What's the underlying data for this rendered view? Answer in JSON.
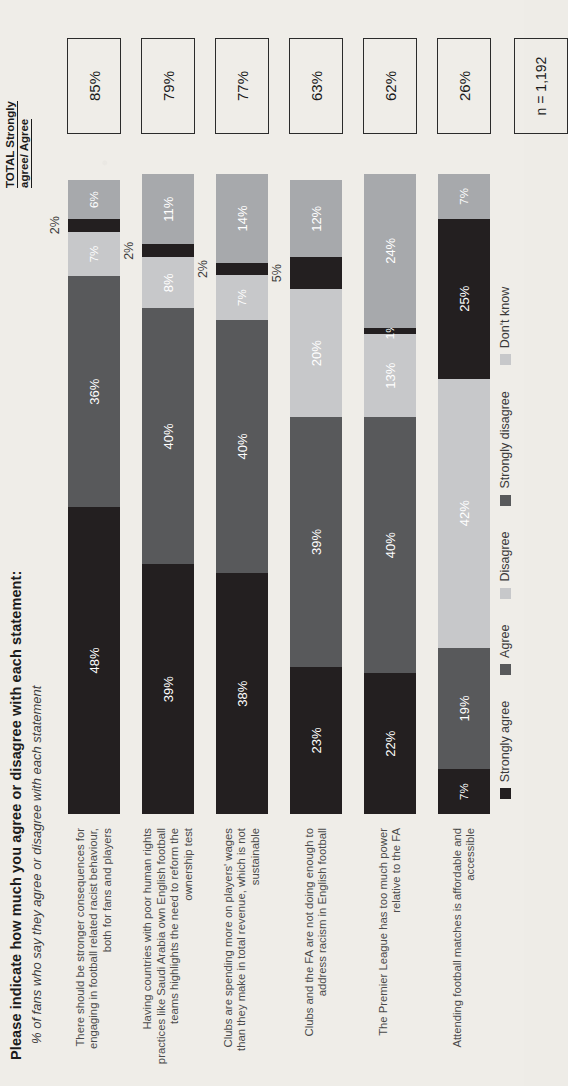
{
  "header": {
    "title": "Please indicate how much you agree or disagree with each statement:",
    "subtitle": "% of fans who say they agree or disagree with each statement",
    "total_column_line1": "TOTAL Strongly",
    "total_column_line2": "agree/ Agree",
    "sample_size": "n = 1,192"
  },
  "chart_data": {
    "type": "bar",
    "orientation": "horizontal-stacked",
    "title": "Please indicate how much you agree or disagree with each statement:",
    "subtitle": "% of fans who say they agree or disagree with each statement",
    "xlabel": "",
    "ylabel": "",
    "xlim": [
      0,
      100
    ],
    "grid": false,
    "legend_position": "bottom",
    "categories": [
      "There should be stronger consequences for engaging in football related racist behaviour, both for fans and players",
      "Having countries with poor human rights practices like Saudi Arabia own English football teams highlights the need to reform the ownership test",
      "Clubs are spending more on players' wages than they make in total revenue, which is not sustainable",
      "Clubs and the FA are not doing enough to address racism in English football",
      "The Premier League has too much power relative to the FA",
      "Attending football matches is affordable and accessible"
    ],
    "series": [
      {
        "name": "Strongly agree",
        "color": "#231f20",
        "values": [
          48,
          39,
          38,
          23,
          22,
          7
        ]
      },
      {
        "name": "Agree",
        "color": "#58595b",
        "values": [
          36,
          40,
          40,
          39,
          40,
          19
        ]
      },
      {
        "name": "Disagree",
        "color": "#c7c8ca",
        "values": [
          7,
          8,
          7,
          20,
          13,
          42
        ]
      },
      {
        "name": "Strongly disagree",
        "color": "#231f20",
        "values": [
          2,
          2,
          2,
          5,
          1,
          25
        ]
      },
      {
        "name": "Don't know",
        "color": "#a7a9ac",
        "values": [
          6,
          11,
          14,
          12,
          24,
          7
        ]
      }
    ],
    "totals": [
      "85%",
      "79%",
      "77%",
      "63%",
      "62%",
      "26%"
    ],
    "annotations": [
      "n = 1,192"
    ]
  },
  "rows": [
    {
      "label": "There should be stronger consequences for engaging in football related racist behaviour, both for fans and players",
      "total": "85%",
      "segments": [
        {
          "name": "Strongly agree",
          "label": "48%",
          "value": 48,
          "inside": true
        },
        {
          "name": "Agree",
          "label": "36%",
          "value": 36,
          "inside": true
        },
        {
          "name": "Disagree",
          "label": "7%",
          "value": 7,
          "inside": true
        },
        {
          "name": "Strongly disagree",
          "label": "2%",
          "value": 2,
          "inside": false
        },
        {
          "name": "Don't know",
          "label": "6%",
          "value": 6,
          "inside": true
        }
      ]
    },
    {
      "label": "Having countries with poor human rights practices like Saudi Arabia own English football teams highlights the need to reform the ownership test",
      "total": "79%",
      "segments": [
        {
          "name": "Strongly agree",
          "label": "39%",
          "value": 39,
          "inside": true
        },
        {
          "name": "Agree",
          "label": "40%",
          "value": 40,
          "inside": true
        },
        {
          "name": "Disagree",
          "label": "8%",
          "value": 8,
          "inside": true
        },
        {
          "name": "Strongly disagree",
          "label": "2%",
          "value": 2,
          "inside": false
        },
        {
          "name": "Don't know",
          "label": "11%",
          "value": 11,
          "inside": true
        }
      ]
    },
    {
      "label": "Clubs are spending more on players' wages than they make in total revenue, which is not sustainable",
      "total": "77%",
      "segments": [
        {
          "name": "Strongly agree",
          "label": "38%",
          "value": 38,
          "inside": true
        },
        {
          "name": "Agree",
          "label": "40%",
          "value": 40,
          "inside": true
        },
        {
          "name": "Disagree",
          "label": "7%",
          "value": 7,
          "inside": true
        },
        {
          "name": "Strongly disagree",
          "label": "2%",
          "value": 2,
          "inside": false
        },
        {
          "name": "Don't know",
          "label": "14%",
          "value": 14,
          "inside": true
        }
      ]
    },
    {
      "label": "Clubs and the FA are not doing enough to address racism in English football",
      "total": "63%",
      "segments": [
        {
          "name": "Strongly agree",
          "label": "23%",
          "value": 23,
          "inside": true
        },
        {
          "name": "Agree",
          "label": "39%",
          "value": 39,
          "inside": true
        },
        {
          "name": "Disagree",
          "label": "20%",
          "value": 20,
          "inside": true
        },
        {
          "name": "Strongly disagree",
          "label": "5%",
          "value": 5,
          "inside": false
        },
        {
          "name": "Don't know",
          "label": "12%",
          "value": 12,
          "inside": true
        }
      ]
    },
    {
      "label": "The Premier League has too much power relative to the FA",
      "total": "62%",
      "segments": [
        {
          "name": "Strongly agree",
          "label": "22%",
          "value": 22,
          "inside": true
        },
        {
          "name": "Agree",
          "label": "40%",
          "value": 40,
          "inside": true
        },
        {
          "name": "Disagree",
          "label": "13%",
          "value": 13,
          "inside": true
        },
        {
          "name": "Strongly disagree",
          "label": "1%",
          "value": 1,
          "inside": true
        },
        {
          "name": "Don't know",
          "label": "24%",
          "value": 24,
          "inside": true
        }
      ]
    },
    {
      "label": "Attending football matches is affordable and accessible",
      "total": "26%",
      "segments": [
        {
          "name": "Strongly agree",
          "label": "7%",
          "value": 7,
          "inside": true
        },
        {
          "name": "Agree",
          "label": "19%",
          "value": 19,
          "inside": true
        },
        {
          "name": "Disagree",
          "label": "42%",
          "value": 42,
          "inside": true
        },
        {
          "name": "Strongly disagree",
          "label": "25%",
          "value": 25,
          "inside": true
        },
        {
          "name": "Don't know",
          "label": "7%",
          "value": 7,
          "inside": true
        }
      ]
    }
  ],
  "legend": [
    {
      "label": "Strongly agree",
      "color": "#231f20"
    },
    {
      "label": "Agree",
      "color": "#58595b"
    },
    {
      "label": "Disagree",
      "color": "#c7c8ca"
    },
    {
      "label": "Strongly disagree",
      "color": "#58595b"
    },
    {
      "label": "Don't know",
      "color": "#c7c8ca"
    }
  ]
}
